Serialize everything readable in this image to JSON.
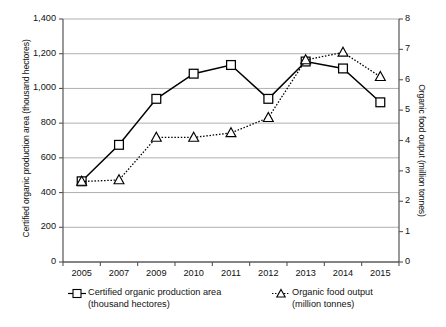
{
  "chart_data": {
    "type": "line",
    "title": "",
    "xlabel": "",
    "grid": "horizontal",
    "legend_position": "bottom",
    "categories": [
      "2005",
      "2007",
      "2009",
      "2010",
      "2011",
      "2012",
      "2013",
      "2014",
      "2015"
    ],
    "axes": {
      "left": {
        "label": "Certified organic production area (thousand hectores)",
        "ylim": [
          0,
          1400
        ],
        "ticks": [
          "0",
          "200",
          "400",
          "600",
          "800",
          "1,000",
          "1,200",
          "1,400"
        ],
        "tick_values": [
          0,
          200,
          400,
          600,
          800,
          1000,
          1200,
          1400
        ]
      },
      "right": {
        "label": "Organic food output (million tonnes)",
        "ylim": [
          0,
          8
        ],
        "ticks": [
          "0",
          "1",
          "2",
          "3",
          "4",
          "5",
          "6",
          "7",
          "8"
        ],
        "tick_values": [
          0,
          1,
          2,
          3,
          4,
          5,
          6,
          7,
          8
        ]
      }
    },
    "series": [
      {
        "name": "Certified organic production area",
        "unit": "(thousand hectores)",
        "axis": "left",
        "marker": "square",
        "line_style": "solid",
        "color": "#000000",
        "values": [
          465,
          675,
          940,
          1085,
          1135,
          940,
          1155,
          1115,
          920
        ]
      },
      {
        "name": "Organic food output",
        "unit": "(million tonnes)",
        "axis": "right",
        "marker": "triangle",
        "line_style": "dotted",
        "color": "#000000",
        "values": [
          2.65,
          2.7,
          4.1,
          4.1,
          4.25,
          4.75,
          6.65,
          6.9,
          6.1
        ]
      }
    ]
  },
  "legend": {
    "items": [
      {
        "label": "Certified organic production area",
        "sub": "(thousand hectores)",
        "marker": "square-marker-icon"
      },
      {
        "label": "Organic food output",
        "sub": "(million tonnes)",
        "marker": "triangle-marker-icon"
      }
    ]
  }
}
